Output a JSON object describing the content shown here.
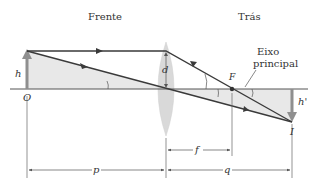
{
  "diagram": {
    "labels": {
      "front": "Frente",
      "back": "Trás",
      "axis": [
        "Eixo",
        "principal"
      ],
      "object_height": "h",
      "object_point": "O",
      "lens_d": "d",
      "focus": "F",
      "image_height": "h'",
      "image_point": "I",
      "dist_p": "p",
      "dist_q": "q",
      "dist_f": "f"
    },
    "colors": {
      "ray": "#3a3a3a",
      "axis": "#555555",
      "arrow_object": "#8f8f8f",
      "shade": "#e8e8e8",
      "lens": "#d9d9d9",
      "dim": "#555555",
      "text": "#333333"
    }
  }
}
